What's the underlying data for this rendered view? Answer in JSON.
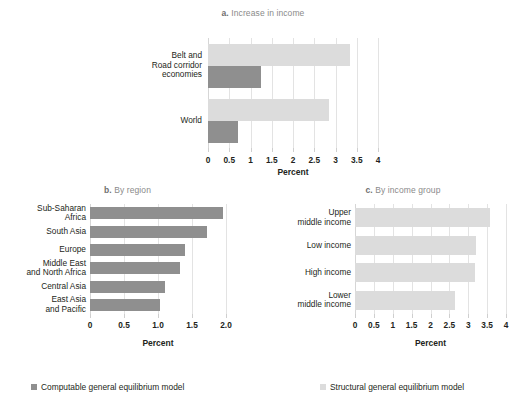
{
  "figure": {
    "percent_label": "Percent",
    "colors": {
      "light_bar": "#dcdcdc",
      "dark_bar": "#8f8f8f",
      "gridline": "#e3e3e3",
      "title_text": "#8a8a8a",
      "body_text": "#231f20"
    }
  },
  "legend": {
    "items": [
      {
        "label": "Computable general equilibrium model",
        "color": "#8f8f8f",
        "swatch": "dark"
      },
      {
        "label": "Structural general equilibrium model",
        "color": "#dcdcdc",
        "swatch": "light"
      }
    ]
  },
  "chart_data": [
    {
      "type": "bar",
      "panel": "a",
      "title": "a. Increase in income",
      "title_prefix": "a.",
      "title_rest": " Increase in income",
      "orientation": "horizontal",
      "categories": [
        "Belt and Road corridor economies",
        "World"
      ],
      "category_lines": [
        [
          "Belt and",
          "Road corridor",
          "economies"
        ],
        [
          "World"
        ]
      ],
      "series": [
        {
          "name": "Structural general equilibrium model",
          "color": "#dcdcdc",
          "values": [
            3.35,
            2.85
          ]
        },
        {
          "name": "Computable general equilibrium model",
          "color": "#8f8f8f",
          "values": [
            1.25,
            0.7
          ]
        }
      ],
      "xlabel": "Percent",
      "ylabel": "",
      "xlim": [
        0,
        4
      ],
      "xticks": [
        0,
        0.5,
        1,
        1.5,
        2,
        2.5,
        3,
        3.5,
        4
      ],
      "xticklabels": [
        "0",
        "0.5",
        "1",
        "1.5",
        "2",
        "2.5",
        "3",
        "3.5",
        "4"
      ],
      "grid": true,
      "legend_position": "bottom"
    },
    {
      "type": "bar",
      "panel": "b",
      "title": "b. By region",
      "title_prefix": "b.",
      "title_rest": " By region",
      "orientation": "horizontal",
      "categories": [
        "Sub-Saharan Africa",
        "South Asia",
        "Europe",
        "Middle East and North Africa",
        "Central Asia",
        "East Asia and Pacific"
      ],
      "category_lines": [
        [
          "Sub-Saharan",
          "Africa"
        ],
        [
          "South Asia"
        ],
        [
          "Europe"
        ],
        [
          "Middle East",
          "and North Africa"
        ],
        [
          "Central Asia"
        ],
        [
          "East Asia",
          "and Pacific"
        ]
      ],
      "series": [
        {
          "name": "Computable general equilibrium model",
          "color": "#8f8f8f",
          "values": [
            1.96,
            1.72,
            1.4,
            1.33,
            1.1,
            1.03
          ]
        }
      ],
      "xlabel": "Percent",
      "ylabel": "",
      "xlim": [
        0,
        2.0
      ],
      "xticks": [
        0,
        0.5,
        1.0,
        1.5,
        2.0
      ],
      "xticklabels": [
        "0",
        "0.5",
        "1.0",
        "1.5",
        "2.0"
      ],
      "grid": true,
      "legend_position": "bottom"
    },
    {
      "type": "bar",
      "panel": "c",
      "title": "c. By income group",
      "title_prefix": "c.",
      "title_rest": " By income group",
      "orientation": "horizontal",
      "categories": [
        "Upper middle income",
        "Low income",
        "High income",
        "Lower middle income"
      ],
      "category_lines": [
        [
          "Upper",
          "middle income"
        ],
        [
          "Low income"
        ],
        [
          "High income"
        ],
        [
          "Lower",
          "middle income"
        ]
      ],
      "series": [
        {
          "name": "Structural general equilibrium model",
          "color": "#dcdcdc",
          "values": [
            3.57,
            3.2,
            3.18,
            2.65
          ]
        }
      ],
      "xlabel": "Percent",
      "ylabel": "",
      "xlim": [
        0,
        4
      ],
      "xticks": [
        0,
        0.5,
        1,
        1.5,
        2,
        2.5,
        3,
        3.5,
        4
      ],
      "xticklabels": [
        "0",
        "0.5",
        "1",
        "1.5",
        "2",
        "2.5",
        "3",
        "3.5",
        "4"
      ],
      "grid": true,
      "legend_position": "bottom"
    }
  ]
}
